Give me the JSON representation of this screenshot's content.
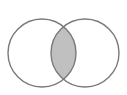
{
  "diagram": {
    "type": "venn",
    "sets": [
      {
        "name": "set-a",
        "cx": 42,
        "cy": 53,
        "r": 34
      },
      {
        "name": "set-b",
        "cx": 85,
        "cy": 53,
        "r": 34
      }
    ],
    "highlighted_region": "intersection",
    "colors": {
      "background": "#ffffff",
      "stroke": "#7a7a7a",
      "fill_highlight": "#c0c0c0",
      "fill_other": "#ffffff"
    }
  }
}
